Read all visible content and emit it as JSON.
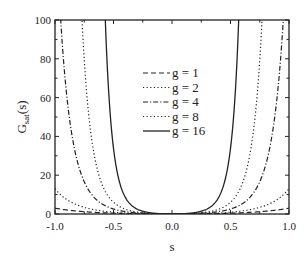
{
  "chart_data": {
    "type": "line",
    "title": "",
    "xlabel": "s",
    "ylabel": "G_sat(s)",
    "ylabel_main": "G",
    "ylabel_sub": "sat",
    "ylabel_tail": "(s)",
    "xlim": [
      -1.0,
      1.0
    ],
    "ylim": [
      0,
      100
    ],
    "xticks": [
      "-1.0",
      "-0.5",
      "0.0",
      "0.5",
      "1.0"
    ],
    "xtick_values": [
      -1.0,
      -0.5,
      0.0,
      0.5,
      1.0
    ],
    "yticks": [
      "0",
      "20",
      "40",
      "60",
      "80",
      "100"
    ],
    "ytick_values": [
      0,
      20,
      40,
      60,
      80,
      100
    ],
    "grid": false,
    "legend_position": "center-inside",
    "series": [
      {
        "name": "g = 1",
        "style": "dashed",
        "k": 1.39,
        "approx_points": [
          [
            -1.0,
            3
          ],
          [
            -0.5,
            0.4
          ],
          [
            0.0,
            0
          ],
          [
            0.5,
            0.4
          ],
          [
            1.0,
            3
          ]
        ]
      },
      {
        "name": "g = 2",
        "style": "dotted",
        "k": 2.64,
        "approx_points": [
          [
            -1.0,
            13
          ],
          [
            -0.5,
            0.9
          ],
          [
            0.0,
            0
          ],
          [
            0.5,
            0.9
          ],
          [
            1.0,
            13
          ]
        ]
      },
      {
        "name": "g = 4",
        "style": "dash-dot",
        "k": 5.1,
        "approx_points": [
          [
            -0.95,
            100
          ],
          [
            -0.8,
            26
          ],
          [
            -0.5,
            2.6
          ],
          [
            0.0,
            0
          ],
          [
            0.5,
            2.6
          ],
          [
            0.8,
            26
          ],
          [
            0.95,
            100
          ]
        ]
      },
      {
        "name": "g = 8",
        "style": "dotted",
        "k": 7.8,
        "approx_points": [
          [
            -0.77,
            100
          ],
          [
            -0.6,
            15
          ],
          [
            -0.5,
            6
          ],
          [
            0.0,
            0
          ],
          [
            0.5,
            6
          ],
          [
            0.6,
            15
          ],
          [
            0.77,
            100
          ]
        ]
      },
      {
        "name": "g = 16",
        "style": "solid",
        "k": 14.2,
        "approx_points": [
          [
            -0.57,
            100
          ],
          [
            -0.45,
            16
          ],
          [
            -0.3,
            2.6
          ],
          [
            0.0,
            0
          ],
          [
            0.3,
            2.6
          ],
          [
            0.45,
            16
          ],
          [
            0.57,
            100
          ]
        ]
      }
    ]
  }
}
